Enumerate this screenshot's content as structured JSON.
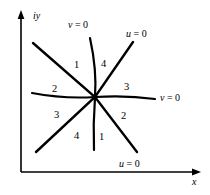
{
  "figure": {
    "type": "complex-plane-sector-diagram",
    "background": "#ffffff",
    "ink": "#000000"
  },
  "axes": {
    "x_label": "x",
    "y_label": "iy",
    "origin": {
      "x": 21,
      "y": 172
    },
    "x_axis_end": {
      "x": 199,
      "y": 172
    },
    "y_axis_end": {
      "x": 21,
      "y": 13
    },
    "arrowheads": [
      "x-axis-right",
      "y-axis-up"
    ]
  },
  "center": {
    "x": 95,
    "y": 97
  },
  "curves": [
    {
      "name": "vertical-curve",
      "label": "v = 0",
      "label_var": "v",
      "label_rhs": "= 0",
      "from": {
        "x": 90,
        "y": 38
      },
      "to": {
        "x": 94,
        "y": 150
      }
    },
    {
      "name": "horizontal-curve",
      "label": "v = 0",
      "label_var": "v",
      "label_rhs": "= 0",
      "from": {
        "x": 32,
        "y": 93
      },
      "to": {
        "x": 155,
        "y": 99
      }
    },
    {
      "name": "diagonal-curve-ne-sw",
      "label": "u = 0",
      "label_var": "u",
      "label_rhs": "= 0",
      "from": {
        "x": 133,
        "y": 42
      },
      "to": {
        "x": 36,
        "y": 152
      }
    },
    {
      "name": "diagonal-curve-nw-se",
      "label": "u = 0",
      "label_var": "u",
      "label_rhs": "= 0",
      "from": {
        "x": 33,
        "y": 43
      },
      "to": {
        "x": 137,
        "y": 152
      }
    }
  ],
  "curve_labels": [
    {
      "name": "v-zero-top",
      "var": "v",
      "rhs": "= 0",
      "x": 68,
      "y": 19
    },
    {
      "name": "u-zero-top",
      "var": "u",
      "rhs": "= 0",
      "x": 126,
      "y": 28
    },
    {
      "name": "v-zero-right",
      "var": "v",
      "rhs": "= 0",
      "x": 160,
      "y": 92
    },
    {
      "name": "u-zero-bottom",
      "var": "u",
      "rhs": "= 0",
      "x": 119,
      "y": 158
    }
  ],
  "sector_labels": [
    {
      "name": "sector-1-upper-left",
      "text": "1",
      "x": 74,
      "y": 59
    },
    {
      "name": "sector-4-upper-right",
      "text": "4",
      "x": 101,
      "y": 58
    },
    {
      "name": "sector-2-left",
      "text": "2",
      "x": 52,
      "y": 83
    },
    {
      "name": "sector-3-right",
      "text": "3",
      "x": 124,
      "y": 81
    },
    {
      "name": "sector-3-lower-left",
      "text": "3",
      "x": 54,
      "y": 109
    },
    {
      "name": "sector-2-lower-right",
      "text": "2",
      "x": 121,
      "y": 110
    },
    {
      "name": "sector-4-bottom-left",
      "text": "4",
      "x": 74,
      "y": 130
    },
    {
      "name": "sector-1-bottom-right",
      "text": "1",
      "x": 99,
      "y": 131
    }
  ]
}
